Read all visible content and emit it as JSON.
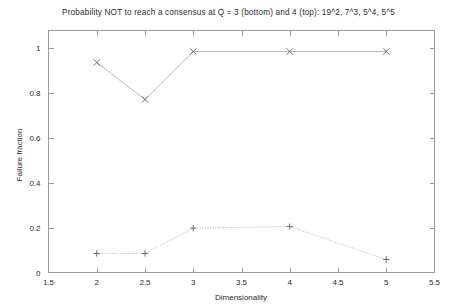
{
  "chart_data": {
    "type": "line",
    "title": "Probability NOT to reach a consensus at Q = 3 (bottom) and 4 (top): 19^2, 7^3, 5^4, 5^5",
    "xlabel": "Dimensionality",
    "ylabel": "Failure fraction",
    "xlim": [
      1.5,
      5.5
    ],
    "ylim": [
      0,
      1.08
    ],
    "xticks": [
      1.5,
      2,
      2.5,
      3,
      3.5,
      4,
      4.5,
      5,
      5.5
    ],
    "xticklabels": [
      "1.5",
      "2",
      "2.5",
      "3",
      "3.5",
      "4",
      "4.5",
      "5",
      "5.5"
    ],
    "yticks": [
      0,
      0.2,
      0.4,
      0.6,
      0.8,
      1
    ],
    "yticklabels": [
      "0",
      "0.2",
      "0.4",
      "0.6",
      "0.8",
      "1"
    ],
    "grid": false,
    "legend": "none",
    "x": [
      2,
      2.5,
      3,
      4,
      5
    ],
    "series": [
      {
        "name": "Q = 4 (top)",
        "marker": "x",
        "linestyle": "solid",
        "color": "#b9b9b9",
        "values": [
          0.937,
          0.772,
          0.986,
          0.986,
          0.986
        ]
      },
      {
        "name": "Q = 3 (bottom)",
        "marker": "+",
        "linestyle": "dotted",
        "color": "#b0b0b0",
        "values": [
          0.085,
          0.085,
          0.198,
          0.205,
          0.058
        ]
      }
    ],
    "point_annotations": [
      "19^2",
      "7^3",
      "5^4",
      "5^5"
    ]
  }
}
